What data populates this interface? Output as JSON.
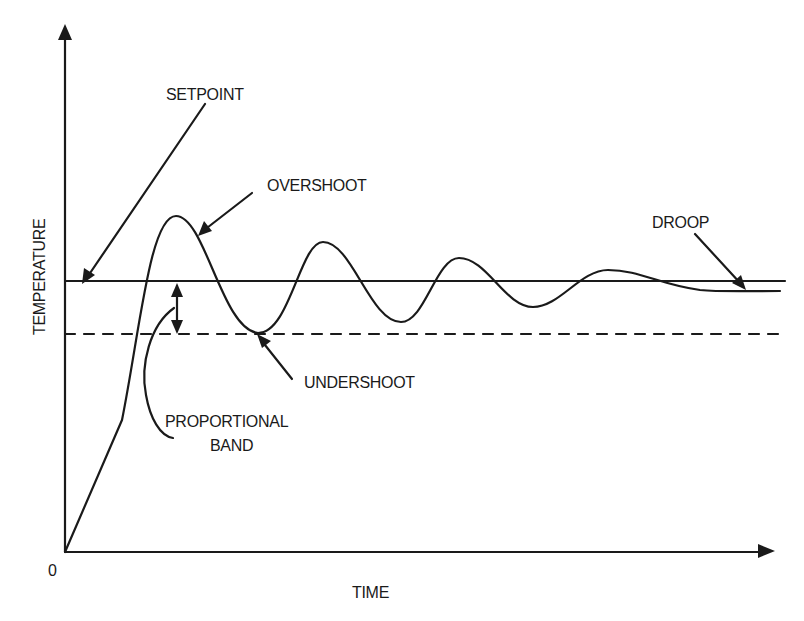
{
  "diagram": {
    "axes": {
      "y_label": "TEMPERATURE",
      "x_label": "TIME",
      "origin_label": "0"
    },
    "annotations": {
      "setpoint": "SETPOINT",
      "overshoot": "OVERSHOOT",
      "droop": "DROOP",
      "undershoot": "UNDERSHOOT",
      "proportional_band_line1": "PROPORTIONAL",
      "proportional_band_line2": "BAND"
    },
    "colors": {
      "ink": "#1a1a1a",
      "background": "#ffffff"
    }
  }
}
